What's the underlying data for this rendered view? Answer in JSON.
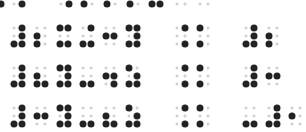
{
  "colors": {
    "raised": "#222222",
    "flat": "#d0d0d0",
    "background": "#ffffff"
  },
  "partial_top_row": [
    {
      "x": 1,
      "on": true
    },
    {
      "x": 14,
      "on": false
    },
    {
      "x": 22,
      "on": true
    },
    {
      "x": 61,
      "on": false
    },
    {
      "x": 69,
      "on": true
    },
    {
      "x": 84,
      "on": true
    },
    {
      "x": 92,
      "on": false
    },
    {
      "x": 107,
      "on": true
    },
    {
      "x": 115,
      "on": false
    },
    {
      "x": 130,
      "on": true
    },
    {
      "x": 138,
      "on": false
    },
    {
      "x": 152,
      "on": true
    },
    {
      "x": 160,
      "on": true
    },
    {
      "x": 177,
      "on": false
    },
    {
      "x": 185,
      "on": false
    },
    {
      "x": 200,
      "on": false
    },
    {
      "x": 208,
      "on": false
    }
  ],
  "braille_rows": [
    {
      "y": 28,
      "cells": [
        {
          "x": 14,
          "dots": [
            3,
            4,
            5,
            6
          ]
        },
        {
          "x": 37,
          "dots": [
            2,
            3
          ]
        },
        {
          "x": 60,
          "dots": [
            1,
            3,
            4,
            6
          ]
        },
        {
          "x": 83,
          "dots": [
            3,
            4,
            6
          ]
        },
        {
          "x": 106,
          "dots": [
            2,
            5
          ]
        },
        {
          "x": 129,
          "dots": [
            1,
            3,
            4,
            5,
            6
          ]
        },
        {
          "x": 177,
          "dots": [
            4,
            6
          ]
        },
        {
          "x": 200,
          "dots": [
            1,
            3
          ]
        },
        {
          "x": 246,
          "dots": [
            3,
            4,
            5,
            6
          ]
        },
        {
          "x": 269,
          "dots": [
            2,
            3
          ]
        }
      ]
    },
    {
      "y": 68,
      "cells": [
        {
          "x": 14,
          "dots": [
            3,
            4,
            5,
            6
          ]
        },
        {
          "x": 37,
          "dots": [
            2,
            3,
            6
          ]
        },
        {
          "x": 60,
          "dots": [
            1,
            3,
            4,
            5,
            6
          ]
        },
        {
          "x": 83,
          "dots": [
            3,
            6
          ]
        },
        {
          "x": 106,
          "dots": [
            2,
            5,
            6
          ]
        },
        {
          "x": 129,
          "dots": [
            1,
            3,
            5,
            6
          ]
        },
        {
          "x": 177,
          "dots": [
            4,
            6
          ]
        },
        {
          "x": 200,
          "dots": [
            1,
            3
          ]
        },
        {
          "x": 246,
          "dots": [
            3,
            4,
            5,
            6
          ]
        },
        {
          "x": 269,
          "dots": [
            2,
            5
          ]
        }
      ]
    },
    {
      "y": 108,
      "cells": [
        {
          "x": 14,
          "dots": [
            3,
            4,
            5,
            6
          ]
        },
        {
          "x": 37,
          "dots": [
            2,
            5
          ]
        },
        {
          "x": 60,
          "dots": [
            1,
            3,
            4,
            5,
            6
          ]
        },
        {
          "x": 83,
          "dots": [
            3,
            6
          ]
        },
        {
          "x": 106,
          "dots": [
            2,
            3,
            6
          ]
        },
        {
          "x": 129,
          "dots": [
            1,
            3,
            5,
            6
          ]
        },
        {
          "x": 177,
          "dots": [
            4,
            6
          ]
        },
        {
          "x": 200,
          "dots": [
            1,
            3
          ]
        },
        {
          "x": 246,
          "dots": [
            3,
            6
          ]
        },
        {
          "x": 269,
          "dots": [
            3,
            4,
            5,
            6
          ]
        },
        {
          "x": 292,
          "dots": [
            2
          ]
        }
      ]
    }
  ]
}
